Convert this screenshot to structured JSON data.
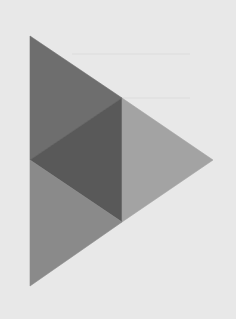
{
  "canvas": {
    "width": 236,
    "height": 319,
    "background": "#e8e8e8"
  },
  "graphic": {
    "icon": "play-triangle-icon",
    "shape": "faceted right-pointing triangle",
    "outline_points": "30,36 213,160 30,286",
    "facets": [
      {
        "name": "upper-facet",
        "points": "30,36 122,98 30,160",
        "fill": "#6e6e6e"
      },
      {
        "name": "middle-facet",
        "points": "30,160 122,98 122,222",
        "fill": "#595959"
      },
      {
        "name": "right-facet",
        "points": "122,98 213,160 122,222",
        "fill": "#a3a3a3"
      },
      {
        "name": "lower-facet",
        "points": "30,160 122,222 30,286",
        "fill": "#8a8a8a"
      }
    ]
  },
  "background_texture": {
    "bleed_through_lines": [
      {
        "x": 72,
        "y": 53,
        "w": 118
      },
      {
        "x": 60,
        "y": 97,
        "w": 130
      }
    ],
    "color": "#dcdcdc"
  }
}
